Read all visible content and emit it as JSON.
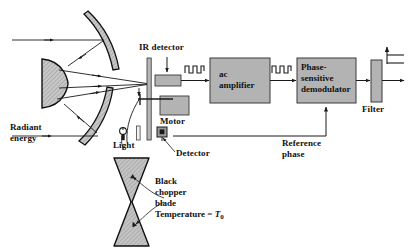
{
  "diagram": {
    "colors": {
      "line": "#1a1a1a",
      "box_fill": "#b3b3b3",
      "box_stroke": "#3a3a3a",
      "mirror_fill": "#c9c9c9",
      "background": "#ffffff"
    },
    "labels": {
      "radiant_energy_line1": "Radiant",
      "radiant_energy_line2": "energy",
      "ir_detector": "IR detector",
      "motor": "Motor",
      "light": "Light",
      "detector": "Detector",
      "reference_phase_line1": "Reference",
      "reference_phase_line2": "phase",
      "filter": "Filter",
      "chopper_line1": "Black",
      "chopper_line2": "chopper",
      "chopper_line3": "blade",
      "chopper_temp_prefix": "Temperature = ",
      "chopper_temp_symbol": "T",
      "chopper_temp_subscript": "0"
    },
    "blocks": [
      {
        "id": "ac-amplifier",
        "line1": "ac",
        "line2": "amplifier"
      },
      {
        "id": "phase-sensitive-demodulator",
        "line1": "Phase-",
        "line2": "sensitive",
        "line3": "demodulator"
      },
      {
        "id": "filter",
        "line1": ""
      }
    ],
    "signals": [
      {
        "id": "chopped-ir-signal",
        "symbol": "square-wave",
        "after": "ir-detector"
      },
      {
        "id": "amplified-ac-signal",
        "symbol": "square-wave",
        "after": "ac-amplifier"
      },
      {
        "id": "dc-output-signal",
        "symbol": "step-level",
        "after": "filter"
      }
    ],
    "components": [
      {
        "id": "secondary-mirror",
        "shape": "d-shaped-convex-mirror"
      },
      {
        "id": "primary-mirror-upper",
        "shape": "concave-arc"
      },
      {
        "id": "primary-mirror-lower",
        "shape": "concave-arc"
      },
      {
        "id": "chopper-blade",
        "shape": "bowtie"
      },
      {
        "id": "lamp",
        "shape": "light-bulb"
      },
      {
        "id": "slit",
        "shape": "vertical-slot"
      },
      {
        "id": "photodetector",
        "shape": "small-square"
      },
      {
        "id": "wall",
        "shape": "vertical-bar"
      }
    ]
  }
}
